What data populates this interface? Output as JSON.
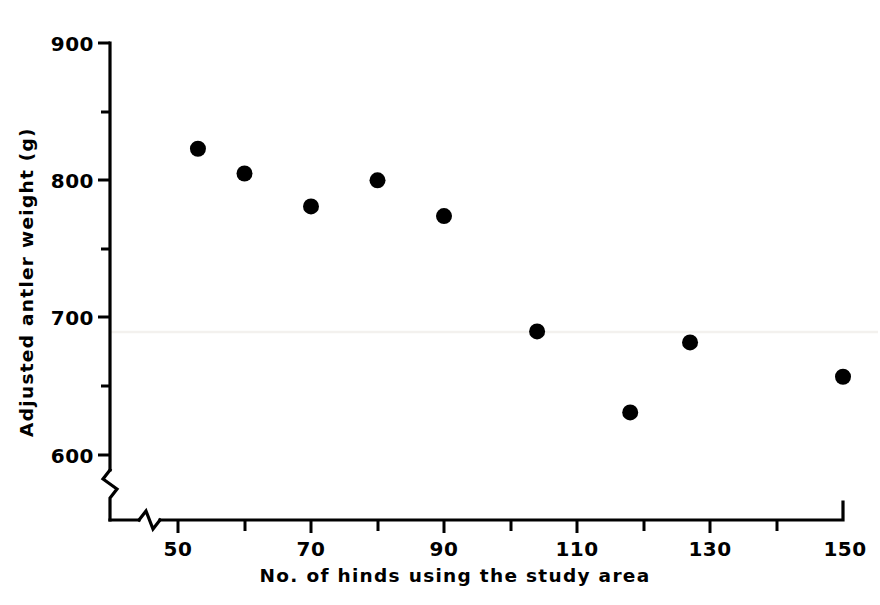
{
  "chart_data": {
    "type": "scatter",
    "title": "",
    "xlabel": "No. of hinds using the study area",
    "ylabel": "Adjusted antler weight (g)",
    "xlim": [
      45,
      150
    ],
    "ylim": [
      595,
      900
    ],
    "grid": false,
    "legend": "none",
    "x_axis": {
      "label": "No. of hinds using the study area",
      "tick_values": [
        50,
        60,
        70,
        80,
        90,
        100,
        110,
        120,
        130,
        140,
        150
      ],
      "labeled_ticks": [
        {
          "value": 50,
          "text": "50"
        },
        {
          "value": 70,
          "text": "70"
        },
        {
          "value": 90,
          "text": "90"
        },
        {
          "value": 110,
          "text": "110"
        },
        {
          "value": 130,
          "text": "130"
        },
        {
          "value": 150,
          "text": "150"
        }
      ],
      "has_axis_break": true
    },
    "y_axis": {
      "label": "Adjusted antler weight (g)",
      "tick_values": [
        600,
        650,
        700,
        750,
        800,
        850,
        900
      ],
      "labeled_ticks": [
        {
          "value": 900,
          "text": "900"
        },
        {
          "value": 800,
          "text": "800"
        },
        {
          "value": 700,
          "text": "700"
        },
        {
          "value": 600,
          "text": "600"
        }
      ],
      "has_axis_break": true
    },
    "series": [
      {
        "name": "population",
        "marker": "filled-circle",
        "color": "#000000",
        "points": [
          {
            "x": 53,
            "y": 823
          },
          {
            "x": 60,
            "y": 805
          },
          {
            "x": 70,
            "y": 781
          },
          {
            "x": 80,
            "y": 800
          },
          {
            "x": 90,
            "y": 774
          },
          {
            "x": 104,
            "y": 690
          },
          {
            "x": 118,
            "y": 631
          },
          {
            "x": 127,
            "y": 682
          },
          {
            "x": 150,
            "y": 657
          }
        ]
      }
    ]
  },
  "colors": {
    "marker": "#000000",
    "axis": "#000000",
    "background": "#ffffff"
  }
}
